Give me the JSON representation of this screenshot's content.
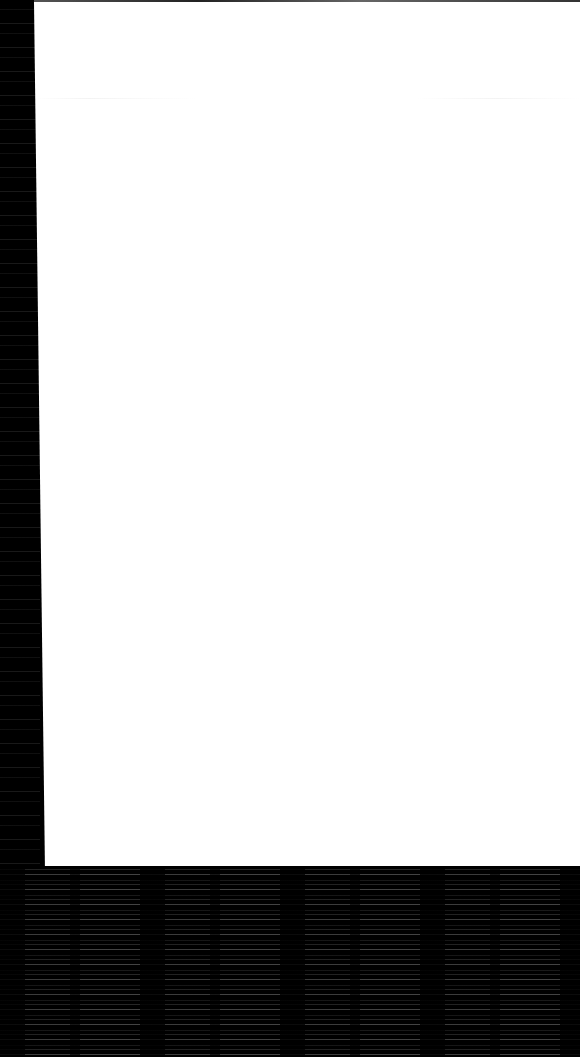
{
  "screen": {
    "state": "blank",
    "page_background": "#ffffff",
    "frame_background": "#000000"
  }
}
